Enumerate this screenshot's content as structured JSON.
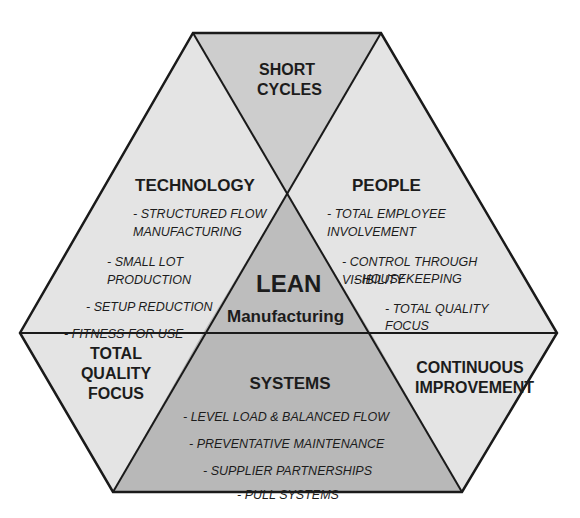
{
  "diagram": {
    "title": "LEAN",
    "subtitle": "Manufacturing",
    "colors": {
      "outer_light": "#e4e4e4",
      "short_cycles": "#cdcdcd",
      "lean_center": "#bdbdbd",
      "systems": "#b8b8b8",
      "lines": "#1a1a1a"
    },
    "sections": {
      "short_cycles": {
        "line1": "SHORT",
        "line2": "CYCLES"
      },
      "technology": {
        "heading": "TECHNOLOGY",
        "items": [
          "-  STRUCTURED FLOW",
          "MANUFACTURING",
          "- SMALL LOT",
          "PRODUCTION",
          "- SETUP REDUCTION",
          "- FITNESS FOR USE"
        ]
      },
      "people": {
        "heading": "PEOPLE",
        "items": [
          "-  TOTAL EMPLOYEE",
          "INVOLVEMENT",
          "-  CONTROL THROUGH",
          "VISIBILITY",
          "-  HOUSEKEEPING",
          "-  TOTAL QUALITY",
          "FOCUS"
        ]
      },
      "total_quality_focus": {
        "line1": "TOTAL",
        "line2": "QUALITY",
        "line3": "FOCUS"
      },
      "continuous_improvement": {
        "line1": "CONTINUOUS",
        "line2": "IMPROVEMENT"
      },
      "systems": {
        "heading": "SYSTEMS",
        "items": [
          "-  LEVEL LOAD & BALANCED FLOW",
          "- PREVENTATIVE MAINTENANCE",
          "- SUPPLIER PARTNERSHIPS",
          "- PULL SYSTEMS"
        ]
      }
    }
  }
}
